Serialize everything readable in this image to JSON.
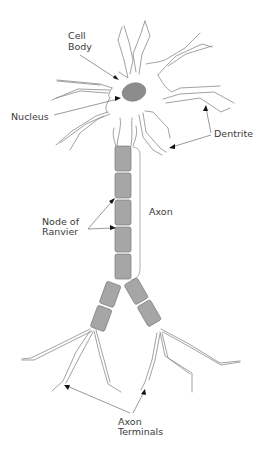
{
  "diagram": {
    "labels": {
      "cell_body": [
        "Cell",
        "Body"
      ],
      "nucleus": "Nucleus",
      "dentrite": "Dentrite",
      "axon": "Axon",
      "node_of_ranvier": [
        "Node of",
        "Ranvier"
      ],
      "axon_terminals": [
        "Axon",
        "Terminals"
      ]
    },
    "colors": {
      "myelin_sheath": "#a6a6a6",
      "nucleus": "#8c8c8c",
      "outline": "#8a8a8a",
      "label_text": "#3a3a3a"
    },
    "myelin_segments_main_axon": 5,
    "myelin_segments_per_branch": 2
  }
}
